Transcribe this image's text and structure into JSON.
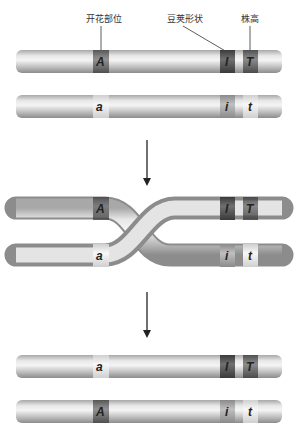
{
  "labels": {
    "flower_position": "开花部位",
    "pod_shape": "豆荚形状",
    "plant_height": "株高"
  },
  "stages": [
    {
      "name": "before",
      "chromosomes": [
        {
          "alleles": [
            "A",
            "I",
            "T"
          ],
          "band_styles": [
            "dominant",
            "dominant-dark",
            "dominant"
          ]
        },
        {
          "alleles": [
            "a",
            "i",
            "t"
          ],
          "band_styles": [
            "light",
            "medium",
            "light"
          ]
        }
      ]
    },
    {
      "name": "crossing-over",
      "chromosomes": [
        {
          "alleles": [
            "A",
            "I",
            "T"
          ]
        },
        {
          "alleles": [
            "a",
            "i",
            "t"
          ]
        }
      ]
    },
    {
      "name": "after",
      "chromosomes": [
        {
          "alleles": [
            "a",
            "I",
            "T"
          ]
        },
        {
          "alleles": [
            "A",
            "i",
            "t"
          ]
        }
      ]
    }
  ],
  "colors": {
    "chromosome": "#c8c8c8",
    "band_dark": "#555555",
    "band_medium": "#8a8a8a",
    "band_light": "#eeeeee",
    "arrow": "#222222"
  }
}
